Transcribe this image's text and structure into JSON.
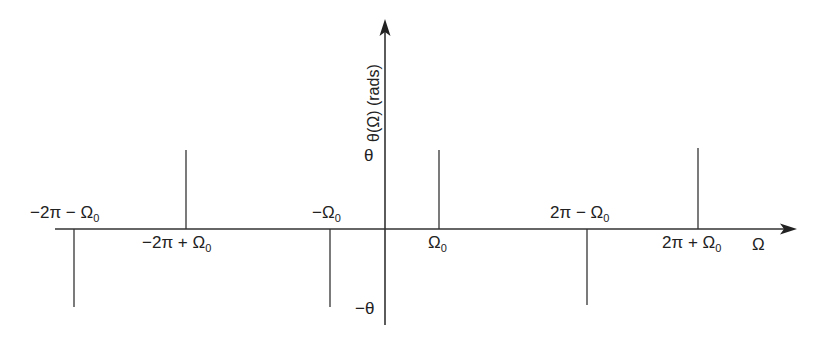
{
  "diagram": {
    "type": "phase-spectrum-stem-plot",
    "axes": {
      "x_label": "Ω",
      "y_label": "θ(Ω) (rads)",
      "y_ticks": {
        "pos": "θ",
        "neg": "−θ"
      }
    },
    "stems": [
      {
        "label": "−2π − Ω",
        "sub": "0",
        "direction": "down",
        "value": "−θ"
      },
      {
        "label": "−2π + Ω",
        "sub": "0",
        "direction": "up",
        "value": "θ"
      },
      {
        "label": "−Ω",
        "sub": "0",
        "direction": "down",
        "value": "−θ"
      },
      {
        "label": "Ω",
        "sub": "0",
        "direction": "up",
        "value": "θ"
      },
      {
        "label": "2π − Ω",
        "sub": "0",
        "direction": "down",
        "value": "−θ"
      },
      {
        "label": "2π + Ω",
        "sub": "0",
        "direction": "up",
        "value": "θ"
      }
    ],
    "colors": {
      "line": "#333333",
      "text": "#222222",
      "background": "#ffffff"
    }
  }
}
